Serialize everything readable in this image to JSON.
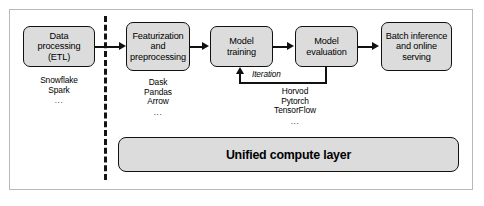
{
  "diagram": {
    "colors": {
      "node_fill": "#dcdcdc",
      "node_border": "#111111",
      "frame_border": "#b9b9b9",
      "divider": "#141414",
      "background": "#ffffff"
    },
    "nodes": [
      {
        "id": "data-processing",
        "label_line1": "Data processing",
        "label_line2": "(ETL)"
      },
      {
        "id": "featurization",
        "label_line1": "Featurization",
        "label_line2": "and",
        "label_line3": "preprocessing"
      },
      {
        "id": "model-training",
        "label_line1": "Model training"
      },
      {
        "id": "model-evaluation",
        "label_line1": "Model",
        "label_line2": "evaluation"
      },
      {
        "id": "batch-inference",
        "label_line1": "Batch inference",
        "label_line2": "and online",
        "label_line3": "serving"
      }
    ],
    "tool_lists": [
      {
        "id": "data-processing-tools",
        "items": [
          "Snowflake",
          "Spark"
        ],
        "ellipsis": "..."
      },
      {
        "id": "featurization-tools",
        "items": [
          "Dask",
          "Pandas",
          "Arrow"
        ],
        "ellipsis": "..."
      },
      {
        "id": "training-tools",
        "items": [
          "Horvod",
          "Pytorch",
          "TensorFlow"
        ],
        "ellipsis": "..."
      }
    ],
    "iteration_label": "Iteration",
    "unified_layer_label": "Unified compute layer"
  }
}
